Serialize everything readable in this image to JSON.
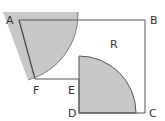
{
  "labels": {
    "A": "A",
    "B": "B",
    "C": "C",
    "D": "D",
    "E": "E",
    "F": "F",
    "R": "R"
  },
  "colors": {
    "shade": "#c8c8c8",
    "line": "#555555"
  }
}
